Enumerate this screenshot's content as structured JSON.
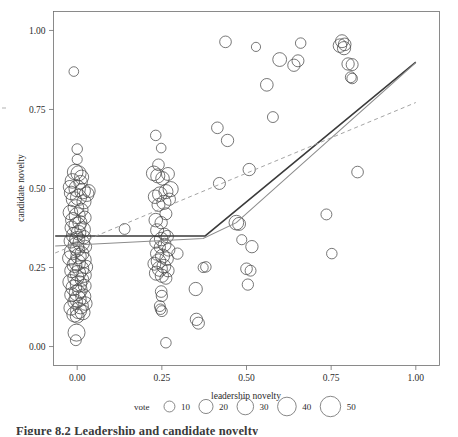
{
  "figure": {
    "caption": "Figure 8.2  Leadership and candidate novelty",
    "axis_x_title": "leadership novelty",
    "axis_y_title": "candidate novelty"
  },
  "legend": {
    "title": "vote",
    "entries": [
      {
        "label": "10",
        "size": 10
      },
      {
        "label": "20",
        "size": 20
      },
      {
        "label": "30",
        "size": 30
      },
      {
        "label": "40",
        "size": 40
      },
      {
        "label": "50",
        "size": 50
      }
    ]
  },
  "chart_data": {
    "type": "scatter",
    "title": "Figure 8.2  Leadership and candidate novelty",
    "xlabel": "leadership novelty",
    "ylabel": "candidate novelty",
    "xlim": [
      -0.07,
      1.07
    ],
    "ylim": [
      -0.06,
      1.06
    ],
    "xticks": [
      0.0,
      0.25,
      0.5,
      0.75,
      1.0
    ],
    "xtick_labels": [
      "0.00",
      "0.25",
      "0.50",
      "0.75",
      "1.00"
    ],
    "yticks": [
      0.0,
      0.25,
      0.5,
      0.75,
      1.0
    ],
    "ytick_labels": [
      "0.00",
      "0.25",
      "0.50",
      "0.75",
      "1.00"
    ],
    "grid": false,
    "legend_position": "bottom",
    "size_variable": "vote",
    "size_legend_values": [
      10,
      20,
      30,
      40,
      50
    ],
    "points": [
      [
        -0.01,
        0.87,
        7
      ],
      [
        0.0,
        0.625,
        9
      ],
      [
        0.0,
        0.592,
        8
      ],
      [
        -0.006,
        0.552,
        26
      ],
      [
        0.004,
        0.548,
        24
      ],
      [
        0.013,
        0.536,
        20
      ],
      [
        -0.014,
        0.524,
        22
      ],
      [
        0.01,
        0.52,
        18
      ],
      [
        -0.022,
        0.505,
        16
      ],
      [
        0.0,
        0.5,
        30
      ],
      [
        0.016,
        0.492,
        26
      ],
      [
        -0.018,
        0.486,
        18
      ],
      [
        0.028,
        0.482,
        22
      ],
      [
        0.004,
        0.472,
        28
      ],
      [
        -0.01,
        0.466,
        24
      ],
      [
        0.02,
        0.458,
        20
      ],
      [
        0.034,
        0.492,
        16
      ],
      [
        -0.004,
        0.44,
        26
      ],
      [
        0.012,
        0.432,
        18
      ],
      [
        -0.02,
        0.424,
        22
      ],
      [
        0.0,
        0.414,
        28
      ],
      [
        0.022,
        0.408,
        16
      ],
      [
        -0.012,
        0.4,
        24
      ],
      [
        0.008,
        0.392,
        20
      ],
      [
        0.0,
        0.383,
        30
      ],
      [
        -0.016,
        0.376,
        18
      ],
      [
        0.016,
        0.37,
        26
      ],
      [
        0.004,
        0.36,
        22
      ],
      [
        -0.008,
        0.352,
        28
      ],
      [
        0.02,
        0.346,
        17
      ],
      [
        0.0,
        0.34,
        24
      ],
      [
        -0.018,
        0.334,
        20
      ],
      [
        0.012,
        0.328,
        30
      ],
      [
        -0.004,
        0.32,
        26
      ],
      [
        0.024,
        0.316,
        15
      ],
      [
        0.0,
        0.308,
        22
      ],
      [
        -0.014,
        0.3,
        28
      ],
      [
        0.014,
        0.294,
        19
      ],
      [
        0.004,
        0.286,
        25
      ],
      [
        -0.022,
        0.28,
        21
      ],
      [
        0.018,
        0.274,
        27
      ],
      [
        0.0,
        0.266,
        30
      ],
      [
        -0.008,
        0.258,
        23
      ],
      [
        0.026,
        0.252,
        17
      ],
      [
        0.01,
        0.246,
        29
      ],
      [
        -0.016,
        0.24,
        20
      ],
      [
        0.002,
        0.232,
        26
      ],
      [
        0.02,
        0.226,
        22
      ],
      [
        -0.004,
        0.218,
        28
      ],
      [
        0.014,
        0.212,
        18
      ],
      [
        -0.02,
        0.204,
        24
      ],
      [
        0.004,
        0.198,
        30
      ],
      [
        0.022,
        0.192,
        16
      ],
      [
        -0.01,
        0.186,
        26
      ],
      [
        0.008,
        0.178,
        22
      ],
      [
        0.0,
        0.17,
        28
      ],
      [
        -0.016,
        0.164,
        20
      ],
      [
        0.018,
        0.158,
        24
      ],
      [
        0.002,
        0.15,
        30
      ],
      [
        -0.006,
        0.142,
        22
      ],
      [
        0.024,
        0.136,
        18
      ],
      [
        0.01,
        0.128,
        26
      ],
      [
        -0.018,
        0.122,
        21
      ],
      [
        0.004,
        0.114,
        28
      ],
      [
        0.016,
        0.108,
        23
      ],
      [
        -0.008,
        0.102,
        25
      ],
      [
        0.0,
        0.096,
        19
      ],
      [
        -0.002,
        0.044,
        32
      ],
      [
        -0.004,
        0.02,
        10
      ],
      [
        0.14,
        0.372,
        10
      ],
      [
        0.232,
        0.668,
        9
      ],
      [
        0.248,
        0.628,
        7
      ],
      [
        0.24,
        0.575,
        12
      ],
      [
        0.226,
        0.548,
        22
      ],
      [
        0.238,
        0.54,
        20
      ],
      [
        0.252,
        0.532,
        18
      ],
      [
        0.268,
        0.546,
        16
      ],
      [
        0.276,
        0.498,
        24
      ],
      [
        0.262,
        0.49,
        20
      ],
      [
        0.244,
        0.482,
        22
      ],
      [
        0.23,
        0.474,
        18
      ],
      [
        0.272,
        0.466,
        14
      ],
      [
        0.256,
        0.456,
        20
      ],
      [
        0.24,
        0.448,
        16
      ],
      [
        0.262,
        0.42,
        13
      ],
      [
        0.232,
        0.4,
        18
      ],
      [
        0.248,
        0.392,
        14
      ],
      [
        0.236,
        0.368,
        16
      ],
      [
        0.258,
        0.356,
        12
      ],
      [
        0.266,
        0.348,
        14
      ],
      [
        0.248,
        0.34,
        18
      ],
      [
        0.232,
        0.33,
        13
      ],
      [
        0.258,
        0.322,
        16
      ],
      [
        0.244,
        0.314,
        11
      ],
      [
        0.27,
        0.306,
        15
      ],
      [
        0.236,
        0.294,
        17
      ],
      [
        0.252,
        0.286,
        20
      ],
      [
        0.264,
        0.278,
        18
      ],
      [
        0.24,
        0.27,
        22
      ],
      [
        0.228,
        0.262,
        16
      ],
      [
        0.256,
        0.254,
        19
      ],
      [
        0.244,
        0.246,
        24
      ],
      [
        0.268,
        0.24,
        14
      ],
      [
        0.234,
        0.232,
        20
      ],
      [
        0.25,
        0.224,
        17
      ],
      [
        0.262,
        0.216,
        13
      ],
      [
        0.248,
        0.174,
        12
      ],
      [
        0.25,
        0.16,
        11
      ],
      [
        0.244,
        0.128,
        10
      ],
      [
        0.246,
        0.118,
        9
      ],
      [
        0.25,
        0.112,
        10
      ],
      [
        0.262,
        0.012,
        9
      ],
      [
        0.296,
        0.294,
        11
      ],
      [
        0.35,
        0.182,
        17
      ],
      [
        0.352,
        0.086,
        14
      ],
      [
        0.358,
        0.074,
        13
      ],
      [
        0.372,
        0.25,
        8
      ],
      [
        0.38,
        0.252,
        9
      ],
      [
        0.414,
        0.692,
        12
      ],
      [
        0.42,
        0.516,
        13
      ],
      [
        0.438,
        0.964,
        12
      ],
      [
        0.444,
        0.652,
        14
      ],
      [
        0.47,
        0.392,
        22
      ],
      [
        0.478,
        0.388,
        16
      ],
      [
        0.486,
        0.338,
        8
      ],
      [
        0.508,
        0.56,
        14
      ],
      [
        0.516,
        0.316,
        14
      ],
      [
        0.5,
        0.246,
        12
      ],
      [
        0.512,
        0.24,
        10
      ],
      [
        0.504,
        0.196,
        11
      ],
      [
        0.528,
        0.948,
        6
      ],
      [
        0.56,
        0.828,
        15
      ],
      [
        0.578,
        0.726,
        10
      ],
      [
        0.598,
        0.908,
        19
      ],
      [
        0.64,
        0.89,
        14
      ],
      [
        0.652,
        0.904,
        13
      ],
      [
        0.66,
        0.96,
        9
      ],
      [
        0.736,
        0.418,
        10
      ],
      [
        0.752,
        0.294,
        9
      ],
      [
        0.776,
        0.952,
        18
      ],
      [
        0.782,
        0.966,
        16
      ],
      [
        0.788,
        0.944,
        17
      ],
      [
        0.79,
        0.956,
        15
      ],
      [
        0.8,
        0.894,
        14
      ],
      [
        0.812,
        0.892,
        13
      ],
      [
        0.808,
        0.852,
        10
      ],
      [
        0.812,
        0.848,
        9
      ],
      [
        0.828,
        0.552,
        12
      ]
    ],
    "lines": [
      {
        "name": "segmented-fit-dark",
        "style": "solid",
        "color": "#3a3a3a",
        "points": [
          [
            -0.065,
            0.35
          ],
          [
            0.378,
            0.35
          ],
          [
            1.0,
            0.9
          ]
        ]
      },
      {
        "name": "segmented-fit-light",
        "style": "solid",
        "color": "#8c8c8c",
        "points": [
          [
            -0.065,
            0.318
          ],
          [
            0.372,
            0.342
          ],
          [
            0.47,
            0.392
          ],
          [
            1.0,
            0.898
          ]
        ]
      },
      {
        "name": "linear-fit-dashed",
        "style": "dashed",
        "color": "#9a9a9a",
        "points": [
          [
            -0.065,
            0.296
          ],
          [
            1.0,
            0.772
          ]
        ]
      }
    ]
  }
}
